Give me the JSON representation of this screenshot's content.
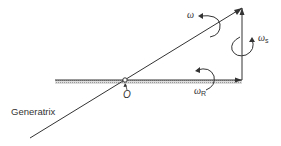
{
  "diagram": {
    "labels": {
      "generatrix": "Generatrix",
      "origin": "O",
      "omega": "ω",
      "omega_s_symbol": "ω",
      "omega_s_sub": "s",
      "omega_r_symbol": "ω",
      "omega_r_sub": "R"
    },
    "colors": {
      "line": "#333333",
      "ground_hatch": "#bbbbbb"
    }
  }
}
